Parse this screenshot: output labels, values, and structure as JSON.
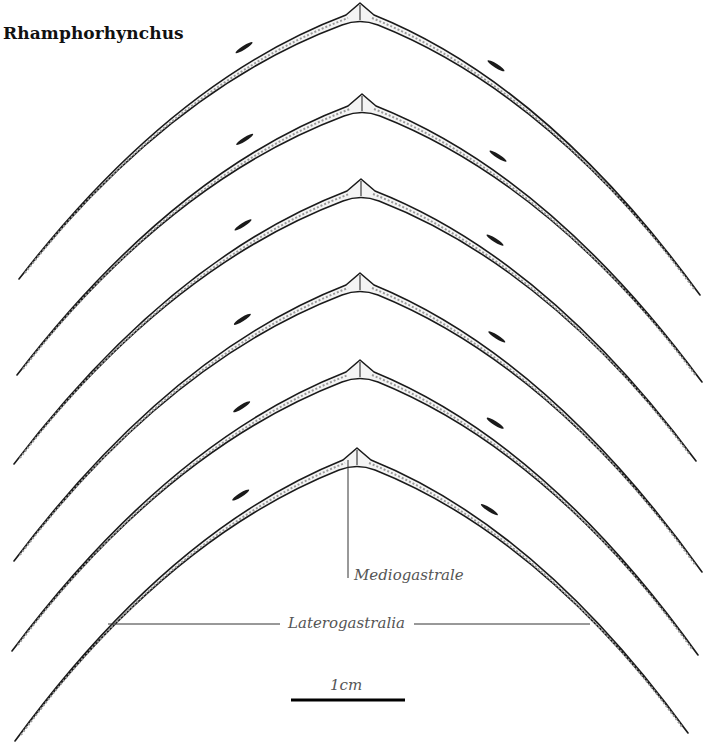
{
  "figure": {
    "title": "Rhamphorhynchus",
    "labels": {
      "mediogastrale": "Mediogastrale",
      "laterogastralia": "Laterogastralia"
    },
    "scale_bar": {
      "label": "1cm",
      "x1": 291,
      "x2": 405,
      "y": 700
    },
    "colors": {
      "ink": "#1a1a1a",
      "fill": "#f4f4f4",
      "shade": "#9a9a9a",
      "label": "#555555"
    },
    "arches": [
      {
        "name": "gastral-rib-1",
        "left": [
          19,
          279
        ],
        "apex": [
          360,
          3
        ],
        "right": [
          700,
          295
        ]
      },
      {
        "name": "gastral-rib-2",
        "left": [
          17,
          375
        ],
        "apex": [
          362,
          94
        ],
        "right": [
          702,
          382
        ]
      },
      {
        "name": "gastral-rib-3",
        "left": [
          14,
          464
        ],
        "apex": [
          361,
          179
        ],
        "right": [
          696,
          461
        ]
      },
      {
        "name": "gastral-rib-4",
        "left": [
          14,
          561
        ],
        "apex": [
          360,
          273
        ],
        "right": [
          702,
          572
        ]
      },
      {
        "name": "gastral-rib-5",
        "left": [
          12,
          651
        ],
        "apex": [
          360,
          360
        ],
        "right": [
          698,
          655
        ]
      },
      {
        "name": "gastral-rib-6",
        "left": [
          15,
          741
        ],
        "apex": [
          357,
          448
        ],
        "right": [
          688,
          733
        ]
      }
    ],
    "leaders": {
      "mediogastrale": {
        "x": 348,
        "y1": 460,
        "y2": 578
      },
      "laterogastralia_left": {
        "x1": 108,
        "x2": 280,
        "y": 624
      },
      "laterogastralia_right": {
        "x1": 414,
        "x2": 590,
        "y": 624
      }
    }
  }
}
